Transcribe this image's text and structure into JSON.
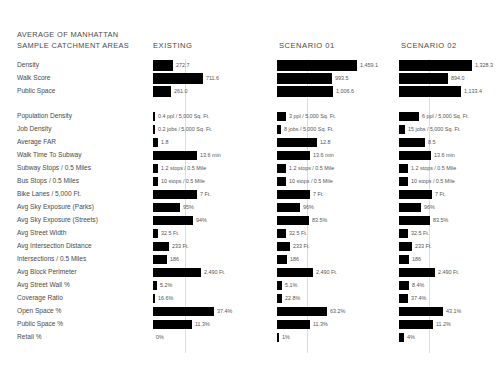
{
  "title": {
    "line1": "AVERAGE OF MANHATTAN",
    "line2": "SAMPLE CATCHMENT AREAS"
  },
  "columns": [
    {
      "key": "existing",
      "label": "EXISTING"
    },
    {
      "key": "scenario01",
      "label": "SCENARIO 01"
    },
    {
      "key": "scenario02",
      "label": "SCENARIO 02"
    }
  ],
  "chart_data": {
    "type": "bar",
    "title": "AVERAGE OF MANHATTAN SAMPLE CATCHMENT AREAS",
    "xlabel": "",
    "ylabel": "",
    "grid": false,
    "legend": "none",
    "orientation": "horizontal",
    "series": [
      {
        "name": "EXISTING"
      },
      {
        "name": "SCENARIO 01"
      },
      {
        "name": "SCENARIO 02"
      }
    ],
    "groups": [
      {
        "name": "summary",
        "rows": [
          {
            "category": "Density",
            "existing": {
              "label": "272.7",
              "width": 20
            },
            "scenario01": {
              "label": "1,459.1",
              "width": 80
            },
            "scenario02": {
              "label": "1,328.3",
              "width": 73
            }
          },
          {
            "category": "Walk Score",
            "existing": {
              "label": "711.6",
              "width": 50
            },
            "scenario01": {
              "label": "993.5",
              "width": 55
            },
            "scenario02": {
              "label": "894.0",
              "width": 49
            }
          },
          {
            "category": "Public Space",
            "existing": {
              "label": "261.0",
              "width": 18
            },
            "scenario01": {
              "label": "1,006.6",
              "width": 56
            },
            "scenario02": {
              "label": "1,133.4",
              "width": 62
            }
          }
        ]
      },
      {
        "name": "metrics",
        "rows": [
          {
            "category": "Population Density",
            "existing": {
              "label": "0.4 ppl / 5,000 Sq. Ft.",
              "width": 2
            },
            "scenario01": {
              "label": "3 ppl / 5,000 Sq. Ft.",
              "width": 9
            },
            "scenario02": {
              "label": "6 ppl / 5,000 Sq. Ft.",
              "width": 20
            }
          },
          {
            "category": "Job Density",
            "existing": {
              "label": "0.2 jobs / 5,000 Sq. Ft.",
              "width": 2
            },
            "scenario01": {
              "label": "8 jobs / 5,000 Sq. Ft.",
              "width": 4
            },
            "scenario02": {
              "label": "15 jobs / 5,000 Sq. Ft.",
              "width": 6
            }
          },
          {
            "category": "Average FAR",
            "existing": {
              "label": "1.8",
              "width": 5
            },
            "scenario01": {
              "label": "12.8",
              "width": 40
            },
            "scenario02": {
              "label": "8.5",
              "width": 26
            }
          },
          {
            "category": "Walk Time To Subway",
            "existing": {
              "label": "13.6 min",
              "width": 44
            },
            "scenario01": {
              "label": "13.6 min",
              "width": 33
            },
            "scenario02": {
              "label": "13.6 min",
              "width": 32
            }
          },
          {
            "category": "Subway Stops / 0.5 Miles",
            "existing": {
              "label": "1.2 stops / 0.5 Mile",
              "width": 5
            },
            "scenario01": {
              "label": "1.2 stops / 0.5 Mile",
              "width": 9
            },
            "scenario02": {
              "label": "1.2 stops / 0.5 Mile",
              "width": 9
            }
          },
          {
            "category": "Bus Stops / 0.5 Miles",
            "existing": {
              "label": "10 stops / 0.5 Mile",
              "width": 5
            },
            "scenario01": {
              "label": "10 stops / 0.5 Mile",
              "width": 9
            },
            "scenario02": {
              "label": "10 stops / 0.5 Mile",
              "width": 9
            }
          },
          {
            "category": "Bike Lanes / 5,000 Ft.",
            "existing": {
              "label": "7 Ft.",
              "width": 44
            },
            "scenario01": {
              "label": "7 Ft.",
              "width": 33
            },
            "scenario02": {
              "label": "7 Ft.",
              "width": 33
            }
          },
          {
            "category": "Avg Sky Exposure (Parks)",
            "existing": {
              "label": "95%",
              "width": 27
            },
            "scenario01": {
              "label": "96%",
              "width": 23
            },
            "scenario02": {
              "label": "96%",
              "width": 22
            }
          },
          {
            "category": "Avg Sky Exposure (Streets)",
            "existing": {
              "label": "94%",
              "width": 40
            },
            "scenario01": {
              "label": "83.5%",
              "width": 32
            },
            "scenario02": {
              "label": "83.5%",
              "width": 31
            }
          },
          {
            "category": "Avg Street Width",
            "existing": {
              "label": "32.5 Ft.",
              "width": 5
            },
            "scenario01": {
              "label": "32.5 Ft.",
              "width": 9
            },
            "scenario02": {
              "label": "32.5 Ft.",
              "width": 9
            }
          },
          {
            "category": "Avg Intersection Distance",
            "existing": {
              "label": "233 Ft.",
              "width": 16
            },
            "scenario01": {
              "label": "233 Ft.",
              "width": 13
            },
            "scenario02": {
              "label": "233 Ft.",
              "width": 13
            }
          },
          {
            "category": "Intersections / 0.5 Miles",
            "existing": {
              "label": "186",
              "width": 14
            },
            "scenario01": {
              "label": "186",
              "width": 10
            },
            "scenario02": {
              "label": "186",
              "width": 10
            }
          },
          {
            "category": "Avg Block Perimeter",
            "existing": {
              "label": "2,490 Ft.",
              "width": 48
            },
            "scenario01": {
              "label": "2,490 Ft.",
              "width": 36
            },
            "scenario02": {
              "label": "2,490 Ft.",
              "width": 36
            }
          },
          {
            "category": "Avg Street Wall %",
            "existing": {
              "label": "5.2%",
              "width": 4
            },
            "scenario01": {
              "label": "5.1%",
              "width": 5
            },
            "scenario02": {
              "label": "8.4%",
              "width": 10
            }
          },
          {
            "category": "Coverage Ratio",
            "existing": {
              "label": "16.6%",
              "width": 2
            },
            "scenario01": {
              "label": "22.8%",
              "width": 5
            },
            "scenario02": {
              "label": "37.4%",
              "width": 9
            }
          },
          {
            "category": "Open Space %",
            "existing": {
              "label": "37.4%",
              "width": 61
            },
            "scenario01": {
              "label": "63.2%",
              "width": 50
            },
            "scenario02": {
              "label": "43.1%",
              "width": 44
            }
          },
          {
            "category": "Public Space %",
            "existing": {
              "label": "11.3%",
              "width": 39
            },
            "scenario01": {
              "label": "11.3%",
              "width": 33
            },
            "scenario02": {
              "label": "11.2%",
              "width": 34
            }
          },
          {
            "category": "Retail %",
            "existing": {
              "label": "0%",
              "width": 0
            },
            "scenario01": {
              "label": "1%",
              "width": 2
            },
            "scenario02": {
              "label": "4%",
              "width": 5
            }
          }
        ]
      }
    ]
  }
}
